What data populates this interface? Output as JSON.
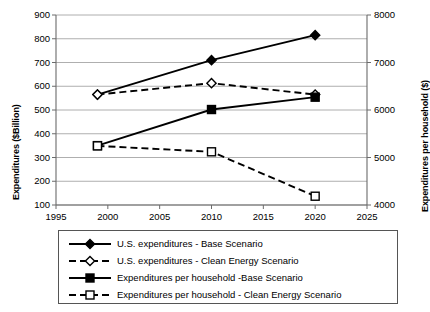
{
  "chart_data": {
    "type": "line",
    "title": "",
    "xlabel": "",
    "ylabel": "Expenditures ($Billion)",
    "y2label": "Expenditures per household ($)",
    "x": [
      1999,
      2010,
      2020
    ],
    "xlim": [
      1995,
      2025
    ],
    "xticks": [
      "1995",
      "2000",
      "2005",
      "2010",
      "2015",
      "2020",
      "2025"
    ],
    "xtick_values": [
      1995,
      2000,
      2005,
      2010,
      2015,
      2020,
      2025
    ],
    "ylim": [
      100,
      900
    ],
    "yticks": [
      "100",
      "200",
      "300",
      "400",
      "500",
      "600",
      "700",
      "800",
      "900"
    ],
    "ytick_values": [
      100,
      200,
      300,
      400,
      500,
      600,
      700,
      800,
      900
    ],
    "y2lim": [
      4000,
      8000
    ],
    "y2ticks": [
      "4000",
      "5000",
      "6000",
      "7000",
      "8000"
    ],
    "y2tick_values": [
      4000,
      5000,
      6000,
      7000,
      8000
    ],
    "grid": true,
    "legend_position": "below",
    "series": [
      {
        "name": "U.S. expenditures - Base Scenario",
        "axis": "left",
        "marker": "filled-diamond",
        "line": "solid",
        "x": [
          1999,
          2010,
          2020
        ],
        "values": [
          565,
          710,
          815
        ]
      },
      {
        "name": "U.S. expenditures - Clean Energy Scenario",
        "axis": "left",
        "marker": "open-diamond",
        "line": "dashed",
        "x": [
          1999,
          2010,
          2020
        ],
        "values": [
          565,
          613,
          565
        ]
      },
      {
        "name": "Expenditures per household -Base Scenario",
        "axis": "right",
        "marker": "filled-square",
        "line": "solid",
        "x": [
          1999,
          2010,
          2020
        ],
        "values": [
          5250,
          6010,
          6270
        ]
      },
      {
        "name": "Expenditures per household - Clean Energy Scenario",
        "axis": "right",
        "marker": "open-square",
        "line": "dashed",
        "x": [
          1999,
          2010,
          2020
        ],
        "values": [
          5245,
          5120,
          4185
        ]
      }
    ]
  },
  "legend": {
    "items": [
      "U.S. expenditures - Base Scenario",
      "U.S. expenditures - Clean Energy Scenario",
      "Expenditures per household -Base Scenario",
      "Expenditures per household - Clean Energy Scenario"
    ]
  },
  "colors": {
    "series": "#000000",
    "grid": "#9a9a9a",
    "axis": "#6b6b6b",
    "background": "#ffffff"
  }
}
